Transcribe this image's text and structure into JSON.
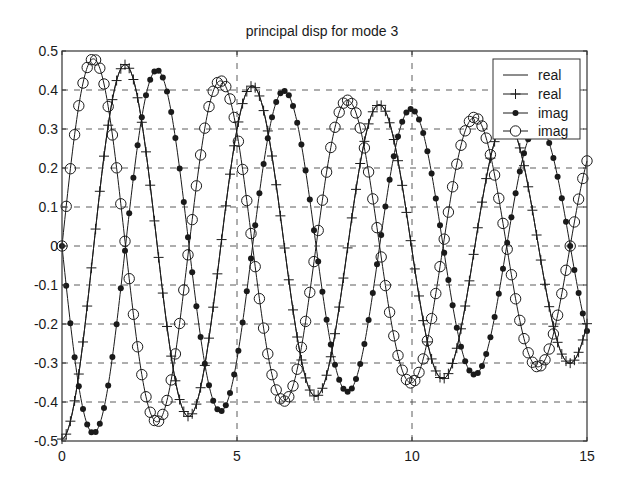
{
  "chart_data": {
    "type": "line",
    "title": "principal disp for mode 3",
    "xlabel": "",
    "ylabel": "",
    "xlim": [
      0,
      15
    ],
    "ylim": [
      -0.5,
      0.5
    ],
    "xticks": [
      0,
      5,
      10,
      15
    ],
    "xtick_labels": [
      "0",
      "5",
      "10",
      "15"
    ],
    "yticks": [
      -0.5,
      -0.4,
      -0.3,
      -0.2,
      -0.1,
      0,
      0.1,
      0.2,
      0.3,
      0.4,
      0.5
    ],
    "ytick_labels": [
      "-0.5",
      "-0.4",
      "-0.3",
      "-0.2",
      "-0.1",
      "0",
      "0.1",
      "0.2",
      "0.3",
      "0.4",
      "0.5"
    ],
    "grid": true,
    "grid_style": "dashed",
    "legend_position": "upper right",
    "legend": [
      {
        "label": "real",
        "style": "line"
      },
      {
        "label": "real",
        "style": "line+plus"
      },
      {
        "label": "imag",
        "style": "line+filled-dot"
      },
      {
        "label": "imag",
        "style": "line+open-circle"
      }
    ],
    "model": {
      "description": "damped sinusoids: envelope = amplitude * exp(-decay * t)",
      "amplitude": 0.495,
      "decay": 0.0344,
      "omega": 1.7309,
      "period": 3.63,
      "marker_step": 0.12
    },
    "x": [
      0,
      0.5,
      1,
      1.5,
      2,
      2.5,
      3,
      3.5,
      4,
      4.5,
      5,
      5.5,
      6,
      6.5,
      7,
      7.5,
      8,
      8.5,
      9,
      9.5,
      10,
      10.5,
      11,
      11.5,
      12,
      12.5,
      13,
      13.5,
      14,
      14.5,
      15
    ],
    "series": [
      {
        "name": "real",
        "marker": "none",
        "form": "-cos",
        "values": [
          -0.495,
          -0.316,
          0.076,
          0.402,
          0.439,
          0.17,
          -0.206,
          -0.428,
          -0.346,
          -0.027,
          0.299,
          0.408,
          0.231,
          -0.099,
          -0.351,
          -0.35,
          -0.108,
          0.202,
          0.36,
          0.265,
          -0.01,
          -0.268,
          -0.333,
          -0.164,
          0.113,
          0.302,
          0.276,
          0.059,
          -0.191,
          -0.301,
          -0.199
        ]
      },
      {
        "name": "real",
        "marker": "plus",
        "form": "-cos",
        "values": [
          -0.495,
          -0.316,
          0.076,
          0.402,
          0.439,
          0.17,
          -0.206,
          -0.428,
          -0.346,
          -0.027,
          0.299,
          0.408,
          0.231,
          -0.099,
          -0.351,
          -0.35,
          -0.108,
          0.202,
          0.36,
          0.265,
          -0.01,
          -0.268,
          -0.333,
          -0.164,
          0.113,
          0.302,
          0.276,
          0.059,
          -0.191,
          -0.301,
          -0.199
        ]
      },
      {
        "name": "imag",
        "marker": "filled-dot",
        "form": "-sin",
        "values": [
          0,
          -0.37,
          -0.472,
          -0.243,
          0.145,
          0.421,
          0.396,
          0.098,
          -0.258,
          -0.423,
          -0.291,
          0.039,
          0.33,
          0.383,
          0.169,
          -0.154,
          -0.36,
          -0.31,
          -0.047,
          0.24,
          0.351,
          0.217,
          -0.064,
          -0.29,
          -0.308,
          -0.112,
          0.155,
          0.306,
          0.239,
          0.01,
          -0.218
        ]
      },
      {
        "name": "imag",
        "marker": "open-circle",
        "form": "sin",
        "values": [
          0,
          0.37,
          0.472,
          0.243,
          -0.145,
          -0.421,
          -0.396,
          -0.098,
          0.258,
          0.423,
          0.291,
          -0.039,
          -0.33,
          -0.383,
          -0.169,
          0.154,
          0.36,
          0.31,
          0.047,
          -0.24,
          -0.351,
          -0.217,
          0.064,
          0.29,
          0.308,
          0.112,
          -0.155,
          -0.306,
          -0.239,
          -0.01,
          0.218
        ]
      }
    ],
    "colors": {
      "line": "#1a1a1a",
      "grid": "#4a4a4a",
      "axes": "#333333",
      "background": "#ffffff"
    }
  }
}
